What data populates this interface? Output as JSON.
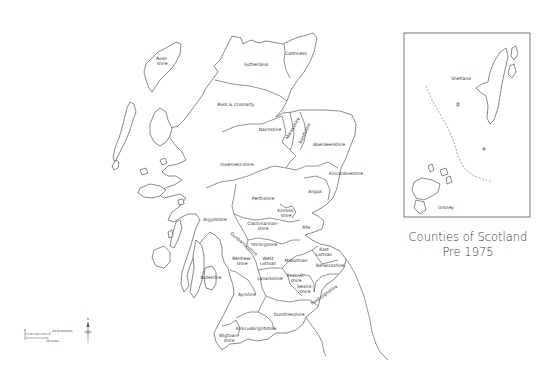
{
  "title": {
    "line1": "Counties of Scotland",
    "line2": "Pre 1975"
  },
  "counties": [
    {
      "name": "Ross-shire",
      "lines": [
        "Ross-",
        "shire"
      ],
      "x": 162,
      "y": 62
    },
    {
      "name": "Sutherland",
      "lines": [
        "Sutherland"
      ],
      "x": 256,
      "y": 66
    },
    {
      "name": "Caithness",
      "lines": [
        "Caithness"
      ],
      "x": 296,
      "y": 55
    },
    {
      "name": "Ross & Cromarty",
      "lines": [
        "Ross & Cromarty"
      ],
      "x": 236,
      "y": 106
    },
    {
      "name": "Nairnshire",
      "lines": [
        "Nairnshire"
      ],
      "x": 270,
      "y": 131
    },
    {
      "name": "Morayshire",
      "lines": [
        "Morayshire"
      ],
      "x": 294,
      "y": 129,
      "rotate": -60
    },
    {
      "name": "Banffshire",
      "lines": [
        "Banffshire"
      ],
      "x": 306,
      "y": 134,
      "rotate": -65
    },
    {
      "name": "Aberdeenshire",
      "lines": [
        "Aberdeenshire"
      ],
      "x": 329,
      "y": 146
    },
    {
      "name": "Inverness-shire",
      "lines": [
        "Inverness-shire"
      ],
      "x": 237,
      "y": 166
    },
    {
      "name": "Kincardineshire",
      "lines": [
        "Kincardineshire"
      ],
      "x": 346,
      "y": 175
    },
    {
      "name": "Angus",
      "lines": [
        "Angus"
      ],
      "x": 315,
      "y": 193
    },
    {
      "name": "Perthshire",
      "lines": [
        "Perthshire"
      ],
      "x": 263,
      "y": 200
    },
    {
      "name": "Kinross-shire",
      "lines": [
        "Kinross-",
        "shire"
      ],
      "x": 286,
      "y": 214
    },
    {
      "name": "Fife",
      "lines": [
        "Fife"
      ],
      "x": 306,
      "y": 229
    },
    {
      "name": "Argyllshire",
      "lines": [
        "Argyllshire"
      ],
      "x": 215,
      "y": 221
    },
    {
      "name": "Clackmannanshire",
      "lines": [
        "Clackmannan-",
        "shire"
      ],
      "x": 263,
      "y": 227
    },
    {
      "name": "Stirlingshire",
      "lines": [
        "Stirlingshire"
      ],
      "x": 264,
      "y": 246
    },
    {
      "name": "Dunbartonshire",
      "lines": [
        "Dunbartonshire"
      ],
      "x": 243,
      "y": 245,
      "rotate": 40
    },
    {
      "name": "Renfrewshire",
      "lines": [
        "Renfrew-",
        "shire"
      ],
      "x": 242,
      "y": 262
    },
    {
      "name": "West Lothian",
      "lines": [
        "West",
        "Lothian"
      ],
      "x": 268,
      "y": 262
    },
    {
      "name": "Midlothian",
      "lines": [
        "Midlothian"
      ],
      "x": 296,
      "y": 262
    },
    {
      "name": "East Lothian",
      "lines": [
        "East",
        "Lothian"
      ],
      "x": 324,
      "y": 253
    },
    {
      "name": "Berwickshire",
      "lines": [
        "Berwickshire"
      ],
      "x": 330,
      "y": 267
    },
    {
      "name": "Buteshire",
      "lines": [
        "Buteshire"
      ],
      "x": 211,
      "y": 279
    },
    {
      "name": "Lanarkshire",
      "lines": [
        "Lanarkshire"
      ],
      "x": 270,
      "y": 280
    },
    {
      "name": "Peebles-shire",
      "lines": [
        "Peebles-",
        "shire"
      ],
      "x": 296,
      "y": 279
    },
    {
      "name": "Selkirkshire",
      "lines": [
        "Selkirk-",
        "shire"
      ],
      "x": 305,
      "y": 290
    },
    {
      "name": "Roxburghshire",
      "lines": [
        "Roxburghshire"
      ],
      "x": 325,
      "y": 296,
      "rotate": -35
    },
    {
      "name": "Ayrshire",
      "lines": [
        "Ayrshire"
      ],
      "x": 247,
      "y": 296
    },
    {
      "name": "Dumfriesshire",
      "lines": [
        "Dumfriesshire"
      ],
      "x": 289,
      "y": 316
    },
    {
      "name": "Kirkcudbrightshire",
      "lines": [
        "Kirkcudbrightshire"
      ],
      "x": 256,
      "y": 330
    },
    {
      "name": "Wigtownshire",
      "lines": [
        "Wigtown-",
        "shire"
      ],
      "x": 229,
      "y": 339
    }
  ],
  "inset": {
    "labels": [
      {
        "name": "Shetland",
        "text": "Shetland",
        "x": 461,
        "y": 80
      },
      {
        "name": "Orkney",
        "text": "Orkney",
        "x": 446,
        "y": 209
      }
    ]
  },
  "scale_bar": {
    "zero": "0",
    "km_label": "40 kilometres",
    "mi_label": "20 miles"
  },
  "compass": {
    "north": "N"
  },
  "colors": {
    "line": "#3a3a3a",
    "background": "#ffffff",
    "text": "#333333"
  }
}
